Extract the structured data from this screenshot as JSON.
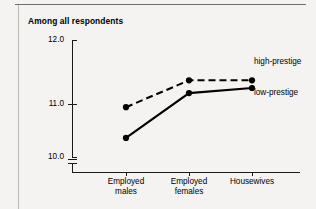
{
  "chart_data": {
    "type": "line",
    "title": "Among all respondents",
    "xlabel": "",
    "ylabel": "",
    "categories": [
      "Employed males",
      "Employed females",
      "Housewives"
    ],
    "category_lines": [
      [
        "Employed",
        "males"
      ],
      [
        "Employed",
        "females"
      ],
      [
        "Housewives",
        ""
      ]
    ],
    "ylim": [
      10.0,
      12.0
    ],
    "yticks": [
      "10.0",
      "11.0",
      "12.0"
    ],
    "ytick_values": [
      10.0,
      11.0,
      12.0
    ],
    "axis_break": true,
    "grid": false,
    "legend_position": "right-inline",
    "series": [
      {
        "name": "high-prestige",
        "style": "dashed",
        "marker": "filled-circle",
        "color": "#000000",
        "values": [
          10.95,
          11.37,
          11.37
        ]
      },
      {
        "name": "low-prestige",
        "style": "solid",
        "marker": "filled-circle",
        "color": "#000000",
        "values": [
          10.47,
          11.17,
          11.25
        ]
      }
    ]
  },
  "chart": {
    "title": "Among all respondents",
    "ytick_labels": [
      "12.0",
      "11.0",
      "10.0"
    ],
    "xtick_labels": [
      {
        "line1": "Employed",
        "line2": "males"
      },
      {
        "line1": "Employed",
        "line2": "females"
      },
      {
        "line1": "Housewives",
        "line2": ""
      }
    ],
    "legend": {
      "high": "high-prestige",
      "low": "low-prestige"
    }
  },
  "colors": {
    "ink": "#000000",
    "page": "#f4f3f1",
    "rule": "#6e6e70",
    "side_rule": "#b9b7b4"
  }
}
